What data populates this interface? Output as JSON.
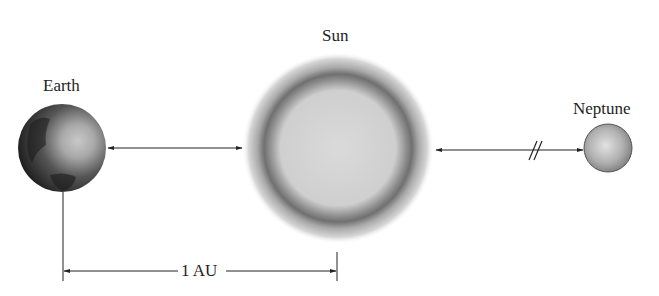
{
  "diagram": {
    "bodies": [
      {
        "id": "earth",
        "label": "Earth"
      },
      {
        "id": "sun",
        "label": "Sun"
      },
      {
        "id": "neptune",
        "label": "Neptune"
      }
    ],
    "distance_label": "1 AU",
    "break_mark": "//",
    "colors": {
      "line": "#222222",
      "earth_dark": "#1f1f1f",
      "earth_light": "#bdbdbd",
      "sun_ring": "#6e6e6e",
      "sun_fill": "#d4d4d4",
      "neptune": "#a8a8a8"
    }
  }
}
